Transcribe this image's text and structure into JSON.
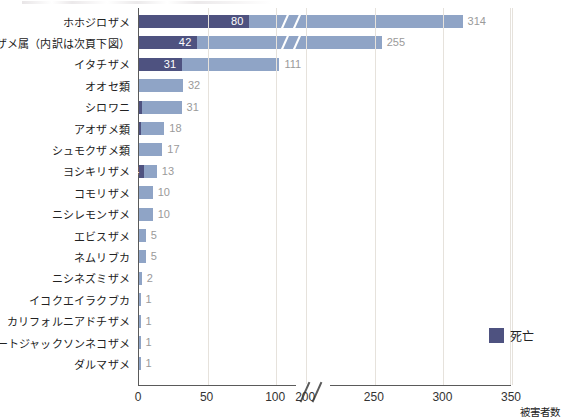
{
  "chart_data": {
    "type": "bar",
    "orientation": "horizontal",
    "title": "",
    "xlabel": "被害者数",
    "ylabel": "",
    "grid": true,
    "legend_position": "inside-right",
    "xlim": [
      0,
      350
    ],
    "xticks": [
      0,
      50,
      100,
      200,
      250,
      300,
      350
    ],
    "xtick_labels": [
      "0",
      "50",
      "100",
      "200",
      "250",
      "300",
      "350"
    ],
    "axis_break": {
      "present": true,
      "between": [
        100,
        200
      ],
      "symbol": "//"
    },
    "series": [
      {
        "name": "死亡",
        "color": "#4e5280"
      },
      {
        "name": "被害者数",
        "color": "#8fa4c6"
      }
    ],
    "categories": [
      "ホホジロザメ",
      "メジロザメ属（内訳は次頁下図）",
      "イタチザメ",
      "オオセ類",
      "シロワニ",
      "アオザメ類",
      "シュモクザメ類",
      "ヨシキリザメ",
      "コモリザメ",
      "ニシレモンザメ",
      "エビスザメ",
      "ネムリブカ",
      "ニシネズミザメ",
      "イコクエイラクブカ",
      "カリフォルニアドチザメ",
      "ポートジャックソンネコザメ",
      "ダルマザメ"
    ],
    "rows": [
      {
        "label": "ホホジロザメ",
        "deaths": 80,
        "deaths_label": "80",
        "total": 314,
        "total_label": "314"
      },
      {
        "label": "メジロザメ属（内訳は次頁下図）",
        "deaths": 42,
        "deaths_label": "42",
        "total": 255,
        "total_label": "255"
      },
      {
        "label": "イタチザメ",
        "deaths": 31,
        "deaths_label": "31",
        "total": 111,
        "total_label": "111"
      },
      {
        "label": "オオセ類",
        "deaths": 0,
        "deaths_label": "",
        "total": 32,
        "total_label": "32"
      },
      {
        "label": "シロワニ",
        "deaths": 2,
        "deaths_label": "2",
        "total": 31,
        "total_label": "31"
      },
      {
        "label": "アオザメ類",
        "deaths": 1,
        "deaths_label": "1",
        "total": 18,
        "total_label": "18"
      },
      {
        "label": "シュモクザメ類",
        "deaths": 0,
        "deaths_label": "",
        "total": 17,
        "total_label": "17"
      },
      {
        "label": "ヨシキリザメ",
        "deaths": 4,
        "deaths_label": "4",
        "total": 13,
        "total_label": "13"
      },
      {
        "label": "コモリザメ",
        "deaths": 0,
        "deaths_label": "",
        "total": 10,
        "total_label": "10"
      },
      {
        "label": "ニシレモンザメ",
        "deaths": 0,
        "deaths_label": "",
        "total": 10,
        "total_label": "10"
      },
      {
        "label": "エビスザメ",
        "deaths": 0,
        "deaths_label": "",
        "total": 5,
        "total_label": "5"
      },
      {
        "label": "ネムリブカ",
        "deaths": 0,
        "deaths_label": "",
        "total": 5,
        "total_label": "5"
      },
      {
        "label": "ニシネズミザメ",
        "deaths": 0,
        "deaths_label": "",
        "total": 2,
        "total_label": "2"
      },
      {
        "label": "イコクエイラクブカ",
        "deaths": 0,
        "deaths_label": "",
        "total": 1,
        "total_label": "1"
      },
      {
        "label": "カリフォルニアドチザメ",
        "deaths": 0,
        "deaths_label": "",
        "total": 1,
        "total_label": "1"
      },
      {
        "label": "ポートジャックソンネコザメ",
        "deaths": 0,
        "deaths_label": "",
        "total": 1,
        "total_label": "1"
      },
      {
        "label": "ダルマザメ",
        "deaths": 0,
        "deaths_label": "",
        "total": 1,
        "total_label": "1"
      }
    ]
  },
  "legend": {
    "label": "死亡",
    "color": "#4e5280"
  },
  "colors": {
    "deaths": "#4e5280",
    "victims": "#8fa4c6",
    "grid": "#e6e2dc",
    "axis": "#5a5a5a",
    "value_text": "#9a9a9a",
    "label_text": "#222222"
  }
}
